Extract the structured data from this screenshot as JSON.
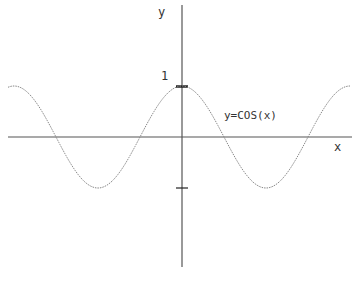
{
  "chart_data": {
    "type": "line",
    "title": "",
    "xlabel": "x",
    "ylabel": "y",
    "series": [
      {
        "name": "y=COS(x)",
        "function": "cos(x)",
        "x": [
          -6.28,
          -4.71,
          -3.14,
          -1.57,
          0,
          1.57,
          3.14,
          4.71,
          6.28
        ],
        "values": [
          1,
          0,
          -1,
          0,
          1,
          0,
          -1,
          0,
          1
        ]
      }
    ],
    "yticks": [
      1,
      -1
    ],
    "ytick_labels": [
      "1",
      ""
    ],
    "xlim": [
      -6.5,
      6.2
    ],
    "ylim": [
      -2.5,
      2.5
    ],
    "grid": false,
    "annotations": [
      {
        "text": "y=COS(x)"
      }
    ]
  },
  "labels": {
    "x_axis": "x",
    "y_axis": "y",
    "tick_one": "1",
    "curve": "y=COS(x)"
  },
  "colors": {
    "axis": "#555555",
    "curve": "#888888",
    "tick": "#222222",
    "text": "#333333"
  }
}
